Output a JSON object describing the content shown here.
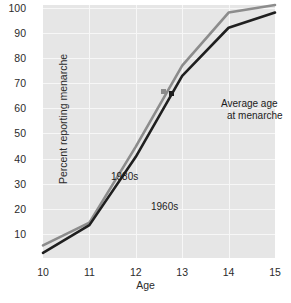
{
  "chart_data": {
    "type": "line",
    "title": "",
    "xlabel": "Age",
    "ylabel": "Percent reporting menarche",
    "x": [
      10,
      11,
      12,
      13,
      14,
      15
    ],
    "xticklabels": [
      "10",
      "11",
      "12",
      "13",
      "14",
      "15"
    ],
    "yticklabels": [
      "10",
      "20",
      "30",
      "40",
      "50",
      "60",
      "70",
      "80",
      "90",
      "100"
    ],
    "yticks": [
      10,
      20,
      30,
      40,
      50,
      60,
      70,
      80,
      90,
      100
    ],
    "xlim": [
      10,
      15
    ],
    "ylim": [
      0,
      100
    ],
    "grid": true,
    "legend_position": "inline-labels",
    "series": [
      {
        "name": "1980s",
        "color": "#8c8c8c",
        "values": [
          5,
          14,
          44,
          76,
          97,
          100
        ],
        "label_text": "1980s"
      },
      {
        "name": "1960s",
        "color": "#1f1f1f",
        "values": [
          2,
          13,
          40,
          72,
          91,
          97
        ],
        "label_text": "1960s"
      }
    ],
    "annotations": [
      {
        "text_line1": "Average age",
        "text_line2": "at menarche",
        "markers": [
          {
            "series": "1980s",
            "x": 12.6,
            "y": 66,
            "color": "#8c8c8c"
          },
          {
            "series": "1960s",
            "x": 12.77,
            "y": 65,
            "color": "#1f1f1f"
          }
        ]
      }
    ],
    "plot_background": "#e6e6e6",
    "gridline_color": "#f7f7f7"
  }
}
